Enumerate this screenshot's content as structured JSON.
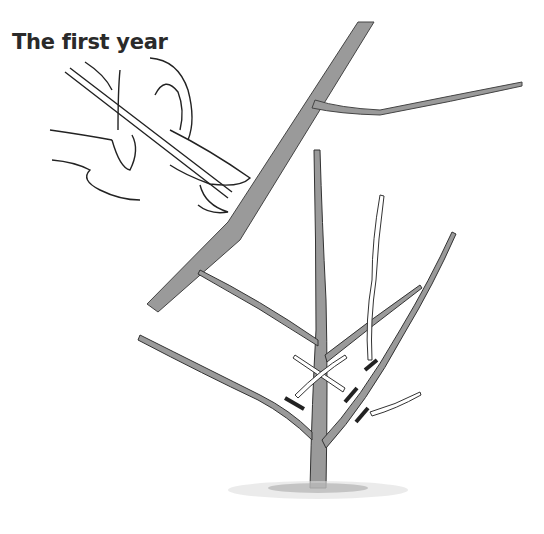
{
  "title": "The first year",
  "illustration": {
    "subject": "pruning a young tree with secateurs",
    "elements": [
      "hand-with-pruners",
      "branch-being-cut",
      "young-tree",
      "cut-marks",
      "ground"
    ],
    "colors": {
      "branch_fill": "#9a9a9a",
      "outline": "#2a2a2a",
      "marks": "#222222",
      "pale_shoot": "#ffffff"
    }
  }
}
